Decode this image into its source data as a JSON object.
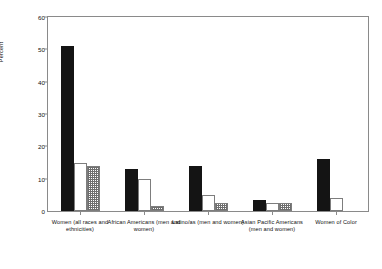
{
  "chart_data": {
    "type": "bar",
    "title": "",
    "xlabel": "",
    "ylabel": "Percent",
    "ylim": [
      0,
      60
    ],
    "yticks": [
      0,
      10,
      20,
      30,
      40,
      50,
      60
    ],
    "ytick_labels": [
      "0",
      "10",
      "20",
      "30",
      "40",
      "50",
      "60"
    ],
    "grid": false,
    "legend": "none",
    "categories": [
      "Women (all races and ethnicities)",
      "African Americans (men and women)",
      "Latino/as (men and women)",
      "Asian Pacific Americans (men and women)",
      "Women of Color"
    ],
    "series": [
      {
        "name": "series-1",
        "fill": "solid-black",
        "values": [
          51,
          13,
          14,
          3.5,
          16
        ]
      },
      {
        "name": "series-2",
        "fill": "open-white",
        "values": [
          15,
          10,
          5,
          2.5,
          4
        ]
      },
      {
        "name": "series-3",
        "fill": "checkered",
        "values": [
          14,
          1.5,
          2.5,
          2.5,
          0
        ]
      }
    ]
  },
  "axis": {
    "y_title": "Percent",
    "zero_label": "0"
  },
  "colors": {
    "solid": "#141414",
    "open_border": "#7d7d7d",
    "hatch_line": "#6e6e6e",
    "frame": "#8a8a8a",
    "text": "#111111",
    "background": "#ffffff"
  }
}
